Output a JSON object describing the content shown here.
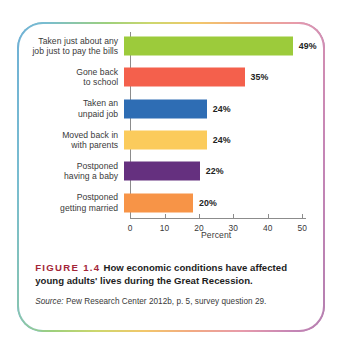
{
  "figure": {
    "number_label": "FIGURE 1.4",
    "caption": "How economic conditions have affected young adults' lives during the Great Recession.",
    "source_label": "Source:",
    "source_text": "Pew Research Center 2012b, p. 5, survey question 29.",
    "number_color": "#a32638"
  },
  "chart_data": {
    "type": "bar",
    "orientation": "horizontal",
    "title": "",
    "xlabel": "Percent",
    "ylabel": "",
    "xlim": [
      0,
      50
    ],
    "xticks": [
      0,
      10,
      20,
      30,
      40,
      50
    ],
    "xtick_labels": [
      "0",
      "10",
      "20",
      "30",
      "40",
      "50"
    ],
    "grid": false,
    "legend": false,
    "categories": [
      "Taken just about any job just to pay the bills",
      "Gone back to school",
      "Taken an unpaid job",
      "Moved back in with parents",
      "Postponed having a baby",
      "Postponed getting married"
    ],
    "category_lines": [
      [
        "Taken just about any",
        "job just to pay the bills"
      ],
      [
        "Gone back",
        "to school"
      ],
      [
        "Taken an",
        "unpaid job"
      ],
      [
        "Moved back in",
        "with parents"
      ],
      [
        "Postponed",
        "having a baby"
      ],
      [
        "Postponed",
        "getting married"
      ]
    ],
    "values": [
      49,
      35,
      24,
      24,
      22,
      20
    ],
    "value_labels": [
      "49%",
      "35%",
      "24%",
      "24%",
      "22%",
      "20%"
    ],
    "colors": [
      "#9ccb3b",
      "#f4604c",
      "#2e6db4",
      "#fbcb5c",
      "#65307f",
      "#f79447"
    ]
  },
  "border": {
    "left_color": "#6fb0d6",
    "top_mid_color": "#9ed07c",
    "right_color": "#b47fb0"
  }
}
